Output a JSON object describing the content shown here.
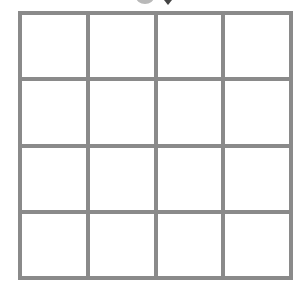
{
  "board": {
    "rows": 4,
    "cols": 4,
    "line_color": "#8a8a8a",
    "cell_color": "#ffffff",
    "cells": [
      [
        "",
        "",
        "",
        ""
      ],
      [
        "",
        "",
        "",
        ""
      ],
      [
        "",
        "",
        "",
        ""
      ],
      [
        "",
        "",
        "",
        ""
      ]
    ]
  },
  "top_decor": {
    "circle_color": "#b9b9b9",
    "arrow_color": "#444444"
  }
}
